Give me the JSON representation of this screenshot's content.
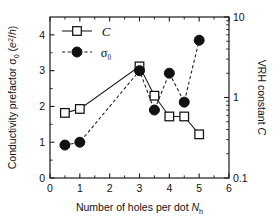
{
  "chart_data": {
    "type": "line",
    "title": "",
    "xlabel": "Number of holes per dot N_h",
    "xlabel_parts": {
      "text": "Number of holes per dot ",
      "symbol": "N",
      "subscript": "h"
    },
    "ylabel_left": "Conductivity prefactor σ₀ (e²/h)",
    "ylabel_left_parts": {
      "text": "Conductivity prefactor ",
      "symbol": "σ",
      "subscript": "0",
      "units_open": " (",
      "units_base": "e",
      "units_sup": "2",
      "units_rest": "/h",
      "units_close": ")"
    },
    "ylabel_right": "VRH constant C",
    "ylabel_right_parts": {
      "text": "VRH constant ",
      "symbol": "C"
    },
    "xlim": [
      0,
      6
    ],
    "xticks": [
      0,
      1,
      2,
      3,
      4,
      5,
      6
    ],
    "xticklabels": [
      "0",
      "1",
      "2",
      "3",
      "4",
      "5",
      "6"
    ],
    "ylim_left": [
      0,
      4.5
    ],
    "yticks_left": [
      0,
      1,
      2,
      3,
      4
    ],
    "yticklabels_left": [
      "0",
      "1",
      "2",
      "3",
      "4"
    ],
    "ylim_right": [
      0.1,
      10
    ],
    "yscale_right": "log",
    "yticks_right": [
      0.1,
      1,
      10
    ],
    "yticklabels_right": [
      "0.1",
      "1",
      "10"
    ],
    "grid": false,
    "legend_position": "upper-left",
    "series": [
      {
        "name": "C",
        "label": "C",
        "axis": "right",
        "marker": "open-square",
        "linestyle": "solid",
        "color": "#111111",
        "x": [
          0.5,
          1,
          3,
          3.5,
          4,
          4.5,
          5
        ],
        "values_left_scale": [
          1.82,
          1.93,
          3.12,
          2.3,
          1.72,
          1.72,
          1.22
        ],
        "values": [
          0.62,
          0.69,
          2.2,
          1.0,
          0.56,
          0.56,
          0.35
        ]
      },
      {
        "name": "sigma_0",
        "label": "σ₀",
        "axis": "left",
        "marker": "filled-circle",
        "linestyle": "dashed",
        "color": "#111111",
        "x": [
          0.5,
          1,
          3,
          3.5,
          4,
          4.5,
          5
        ],
        "values": [
          0.92,
          1.0,
          3.0,
          1.9,
          2.93,
          2.12,
          3.85
        ]
      }
    ],
    "legend_entries": [
      {
        "label": "C",
        "marker": "open-square",
        "linestyle": "solid"
      },
      {
        "label": "σ₀",
        "marker": "filled-circle",
        "linestyle": "dashed"
      }
    ]
  }
}
